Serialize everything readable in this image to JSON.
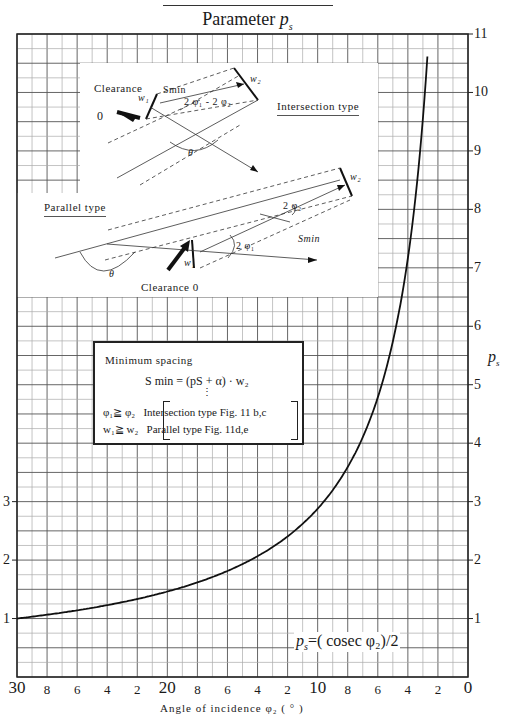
{
  "header": {
    "title_prefix": "Parameter ",
    "title_symbol": "p",
    "title_subscript": "s"
  },
  "axes": {
    "x_label": "Angle of incidence φ₂ ( ° )",
    "y_label_symbol": "p",
    "y_label_subscript": "s",
    "y_ticks_right": [
      "1",
      "2",
      "3",
      "4",
      "5",
      "6",
      "7",
      "8",
      "9",
      "10",
      "11"
    ],
    "y_ticks_left": [
      "1",
      "2",
      "3"
    ],
    "x_ticks": [
      {
        "label": "30",
        "major": true
      },
      {
        "label": "8",
        "major": false
      },
      {
        "label": "6",
        "major": false
      },
      {
        "label": "4",
        "major": false
      },
      {
        "label": "2",
        "major": false
      },
      {
        "label": "20",
        "major": true
      },
      {
        "label": "8",
        "major": false
      },
      {
        "label": "6",
        "major": false
      },
      {
        "label": "4",
        "major": false
      },
      {
        "label": "2",
        "major": false
      },
      {
        "label": "10",
        "major": true
      },
      {
        "label": "8",
        "major": false
      },
      {
        "label": "6",
        "major": false
      },
      {
        "label": "4",
        "major": false
      },
      {
        "label": "2",
        "major": false
      },
      {
        "label": "0",
        "major": true
      }
    ]
  },
  "curve_label": {
    "lhs_symbol": "p",
    "lhs_subscript": "s",
    "rhs": "=( cosec φ₂)/2"
  },
  "formula_box": {
    "title": "Minimum spacing",
    "equation": "S min = (pS + α) · w₂",
    "ellipsis": "⋮",
    "cond1_left": "φ₁≧ φ₂",
    "cond1_right": "Intersection type Fig. 11 b,c",
    "cond2_left": "w₁≧ w₂",
    "cond2_right": "Parallel type Fig. 11d,e"
  },
  "diagram": {
    "clearance_label": "Clearance",
    "clearance_zero_top": "0",
    "intersection_type": "Intersection type",
    "parallel_type": "Parallel type",
    "clearance_zero_bottom": "Clearance 0",
    "w1": "w₁",
    "w2": "w₂",
    "smin": "Smin",
    "angle_int": "2 φ₁ - 2 φ₂",
    "angle_phi2": "2 φ₂",
    "angle_phi1": "2 φ₁",
    "theta": "θ"
  },
  "chart_data": {
    "type": "line",
    "xlabel": "Angle of incidence φ₂ (°)",
    "ylabel": "p_s",
    "formula": "p_s = (cosec φ₂)/2",
    "xlim": [
      30,
      0
    ],
    "ylim": [
      0,
      11
    ],
    "x_reversed": true,
    "grid": true,
    "x_minor_step": 1,
    "y_minor_step": 0.25,
    "series": [
      {
        "name": "p_s = (cosec φ₂)/2",
        "x": [
          30,
          28,
          26,
          24,
          22,
          20,
          18,
          16,
          14,
          12,
          10,
          9,
          8,
          7,
          6,
          5,
          4,
          3.5,
          3,
          2.6
        ],
        "values": [
          1.0,
          1.065,
          1.141,
          1.229,
          1.335,
          1.462,
          1.618,
          1.814,
          2.067,
          2.405,
          2.879,
          3.196,
          3.593,
          4.103,
          4.783,
          5.737,
          7.168,
          8.19,
          9.554,
          11.0
        ]
      }
    ]
  }
}
